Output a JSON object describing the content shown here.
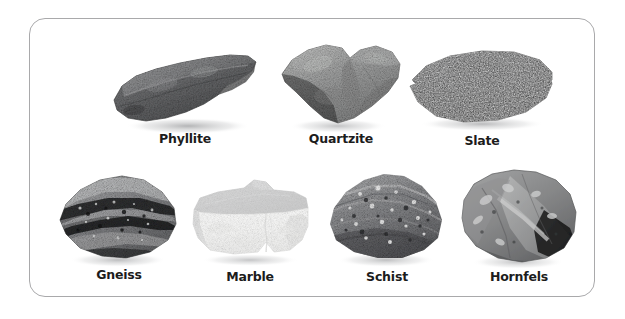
{
  "figure": {
    "type": "labeled-specimen-chart",
    "background_color": "#ffffff",
    "frame": {
      "border_color": "#a9a9ab",
      "corner_radius_px": 16,
      "fill_color": "#ffffff"
    },
    "rows": 2,
    "columns_row1": 3,
    "columns_row2": 4
  },
  "specimens": [
    {
      "label": "Phyllite",
      "row": 1,
      "column": 1,
      "shape": "elongated-diagonal-slab",
      "tone": "dark-gray",
      "base_color": "#6f7073",
      "shadow_color": "#a5a6a8"
    },
    {
      "label": "Quartzite",
      "row": 1,
      "column": 2,
      "shape": "chunky-heart-block",
      "tone": "medium-gray",
      "base_color": "#9a9b9c",
      "shadow_color": "#b6b7b8"
    },
    {
      "label": "Slate",
      "row": 1,
      "column": 3,
      "shape": "flat-rectangular-slab",
      "tone": "near-black",
      "base_color": "#2b2c2e",
      "shadow_color": "#8f9092"
    },
    {
      "label": "Gneiss",
      "row": 2,
      "column": 1,
      "shape": "banded-rounded-lump",
      "tone": "black-and-light-banded",
      "base_color": "#7b7c7e",
      "shadow_color": "#b0b1b3"
    },
    {
      "label": "Marble",
      "row": 2,
      "column": 2,
      "shape": "cut-block-with-gray-top",
      "tone": "white",
      "base_color": "#f1f1ef",
      "shadow_color": "#a8a9ab"
    },
    {
      "label": "Schist",
      "row": 2,
      "column": 3,
      "shape": "speckled-wedge",
      "tone": "medium-gray-sparkly",
      "base_color": "#86878a",
      "shadow_color": "#b3b4b6"
    },
    {
      "label": "Hornfels",
      "row": 2,
      "column": 4,
      "shape": "rounded-faceted-cobble",
      "tone": "light-medium-gray",
      "base_color": "#9c9d9e",
      "shadow_color": "#b6b7b9"
    }
  ]
}
